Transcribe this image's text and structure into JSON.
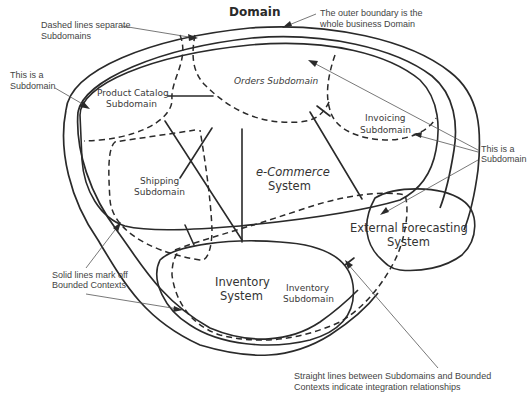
{
  "diagram": {
    "title": "Domain",
    "annotations": {
      "dashed_lines": [
        "Dashed lines separate",
        "Subdomains"
      ],
      "outer_boundary": [
        "The outer boundary is the",
        "whole business Domain"
      ],
      "subdomain_left": [
        "This is a",
        "Subdomain"
      ],
      "subdomain_right": [
        "This is a",
        "Subdomain"
      ],
      "solid_lines": [
        "Solid lines mark off",
        "Bounded Contexts"
      ],
      "straight_lines": [
        "Straight lines between Subdomains and Bounded",
        "Contexts indicate integration relationships"
      ]
    },
    "subdomains": {
      "product_catalog": [
        "Product Catalog",
        "Subdomain"
      ],
      "orders": [
        "Orders Subdomain"
      ],
      "invoicing": [
        "Invoicing",
        "Subdomain"
      ],
      "shipping": [
        "Shipping",
        "Subdomain"
      ],
      "inventory": [
        "Inventory",
        "Subdomain"
      ]
    },
    "bounded_contexts": {
      "ecommerce": [
        "e-Commerce",
        "System"
      ],
      "inventory": [
        "Inventory",
        "System"
      ],
      "external_forecasting": [
        "External Forecasting",
        "System"
      ]
    },
    "colors": {
      "stroke": "#2a2a2a",
      "annotation_text": "#444444",
      "background": "#ffffff"
    }
  }
}
